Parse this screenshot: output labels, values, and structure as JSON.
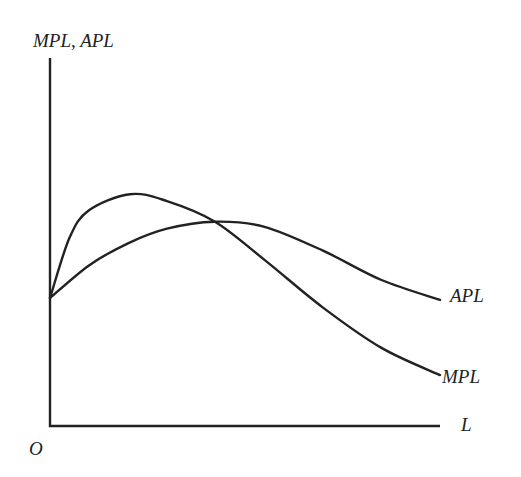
{
  "chart_data": {
    "type": "line",
    "title": "",
    "xlabel": "L",
    "ylabel": "MPL, APL",
    "origin_label": "O",
    "xlim": [
      0,
      10
    ],
    "ylim": [
      0,
      10
    ],
    "grid": false,
    "ticks": false,
    "legend": "curve-end labels (right)",
    "series": [
      {
        "name": "MPL",
        "color": "#222222",
        "x": [
          0,
          0.5,
          1.0,
          2.05,
          3.0,
          4.23,
          5.5,
          7.0,
          8.5,
          10
        ],
        "y": [
          3.46,
          5.1,
          5.85,
          6.29,
          6.1,
          5.54,
          4.5,
          3.2,
          2.1,
          1.36
        ]
      },
      {
        "name": "APL",
        "color": "#222222",
        "x": [
          0,
          1.0,
          2.0,
          3.0,
          4.23,
          5.5,
          7.0,
          8.5,
          10
        ],
        "y": [
          3.46,
          4.35,
          4.95,
          5.35,
          5.54,
          5.4,
          4.75,
          3.95,
          3.41
        ]
      }
    ],
    "annotations": [
      {
        "text": "APL",
        "at": "end of APL curve"
      },
      {
        "text": "MPL",
        "at": "end of MPL curve"
      }
    ]
  }
}
